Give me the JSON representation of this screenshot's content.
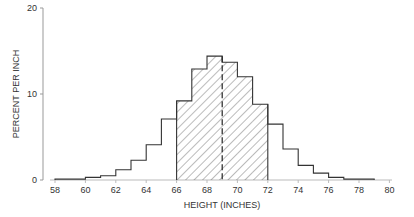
{
  "chart_data": {
    "type": "bar",
    "subtype": "histogram",
    "title": "",
    "xlabel": "HEIGHT (INCHES)",
    "ylabel": "PERCENT PER INCH",
    "xlim": [
      58,
      80
    ],
    "ylim": [
      0,
      20
    ],
    "x_ticks": [
      58,
      60,
      62,
      64,
      66,
      68,
      70,
      72,
      74,
      76,
      78,
      80
    ],
    "y_ticks": [
      0,
      10,
      20
    ],
    "grid": false,
    "legend": null,
    "bin_width": 1,
    "bins": [
      {
        "start": 58,
        "end": 59,
        "value": 0.1
      },
      {
        "start": 59,
        "end": 60,
        "value": 0.1
      },
      {
        "start": 60,
        "end": 61,
        "value": 0.3
      },
      {
        "start": 61,
        "end": 62,
        "value": 0.5
      },
      {
        "start": 62,
        "end": 63,
        "value": 1.2
      },
      {
        "start": 63,
        "end": 64,
        "value": 2.3
      },
      {
        "start": 64,
        "end": 65,
        "value": 4.1
      },
      {
        "start": 65,
        "end": 66,
        "value": 7.1
      },
      {
        "start": 66,
        "end": 67,
        "value": 9.2
      },
      {
        "start": 67,
        "end": 68,
        "value": 12.9
      },
      {
        "start": 68,
        "end": 69,
        "value": 14.4
      },
      {
        "start": 69,
        "end": 70,
        "value": 13.7
      },
      {
        "start": 70,
        "end": 71,
        "value": 12.0
      },
      {
        "start": 71,
        "end": 72,
        "value": 8.8
      },
      {
        "start": 72,
        "end": 73,
        "value": 6.5
      },
      {
        "start": 73,
        "end": 74,
        "value": 3.6
      },
      {
        "start": 74,
        "end": 75,
        "value": 1.7
      },
      {
        "start": 75,
        "end": 76,
        "value": 0.8
      },
      {
        "start": 76,
        "end": 77,
        "value": 0.3
      },
      {
        "start": 77,
        "end": 78,
        "value": 0.1
      },
      {
        "start": 78,
        "end": 79,
        "value": 0.1
      }
    ],
    "shaded_range": [
      66,
      72
    ],
    "shading": "diagonal-hatch",
    "annotations": [
      {
        "type": "dashed-vertical-line",
        "x": 69
      }
    ]
  }
}
